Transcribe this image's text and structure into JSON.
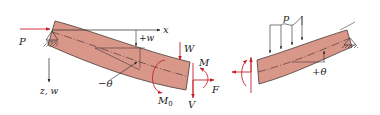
{
  "diagram": {
    "left_beam": {
      "labels": {
        "axial_load": "P",
        "x_axis": "x",
        "z_axis": "z, w",
        "deflection": "+w",
        "rotation": "−θ",
        "transverse_load": "W",
        "applied_moment": "M",
        "applied_moment_sub": "0",
        "internal_moment": "M",
        "shear_force": "V",
        "axial_force": "F"
      }
    },
    "right_beam": {
      "labels": {
        "distributed_load": "p",
        "rotation": "+θ"
      }
    },
    "colors": {
      "beam_fill": "#d9978a",
      "beam_stroke": "#4a3a36",
      "force_arrow": "#c8202a",
      "axis": "#222222",
      "support": "#333333"
    }
  }
}
